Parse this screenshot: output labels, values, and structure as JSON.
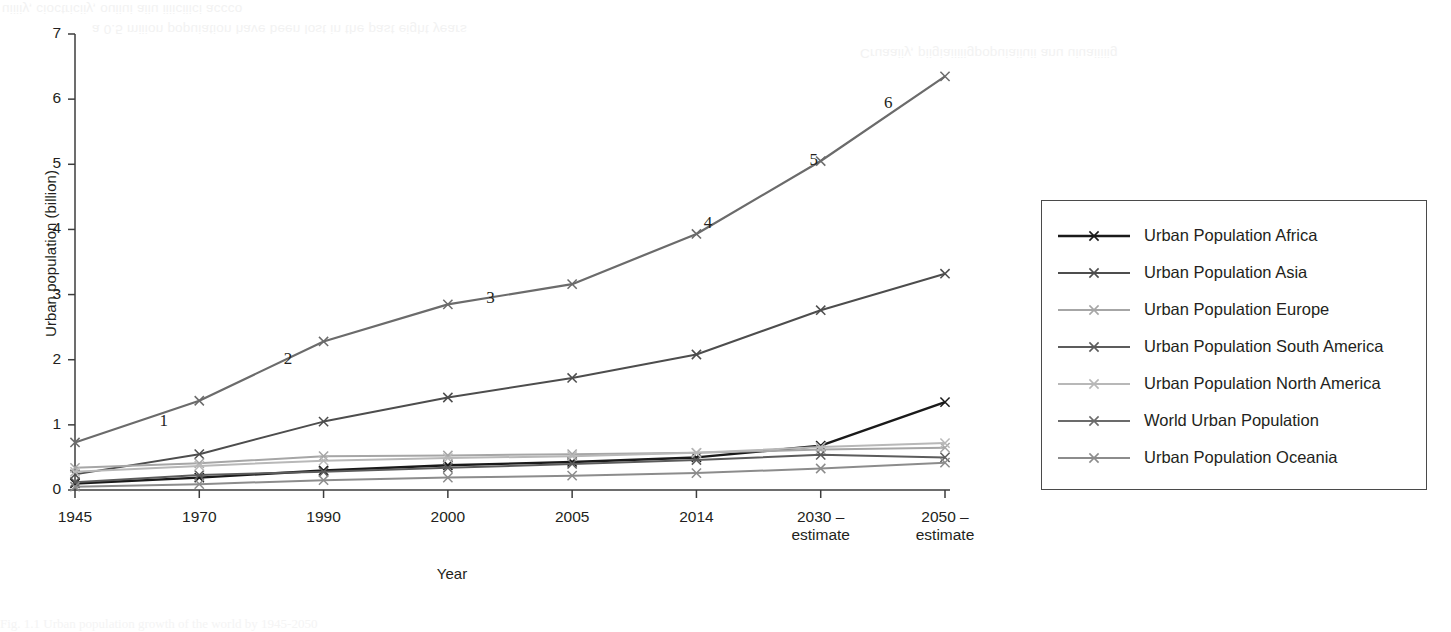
{
  "page": {
    "background_color": "#ffffff",
    "ink_color": "#231f20",
    "bleed_through_top": [
      "uiiiiy, cioctriciiy, ouiiui aiiu iiiiciiici accco",
      "a 0.5 miiion popuiation have been lost in the past eight years",
      "Cruaaiiy, piigiaiiiiigpopuiaiiuii anu uiuaiiiiig"
    ],
    "bleed_through_bottom": "Fig. 1.1 Urban population growth of the world by 1945-2050"
  },
  "chart_data": {
    "type": "line",
    "title": "",
    "xlabel": "Year",
    "ylabel": "Urban population (billion)",
    "ylim": [
      0,
      7
    ],
    "yticks": [
      0,
      1,
      2,
      3,
      4,
      5,
      6,
      7
    ],
    "ytick_labels": [
      "0",
      "1",
      "2",
      "3",
      "4",
      "5",
      "6",
      "7"
    ],
    "grid": false,
    "legend_position": "right-outside",
    "marker": "x",
    "categories": [
      "1945",
      "1970",
      "1990",
      "2000",
      "2005",
      "2014",
      "2030 –\nestimate",
      "2050 –\nestimate"
    ],
    "xtick_labels": [
      {
        "line1": "1945",
        "line2": ""
      },
      {
        "line1": "1970",
        "line2": ""
      },
      {
        "line1": "1990",
        "line2": ""
      },
      {
        "line1": "2000",
        "line2": ""
      },
      {
        "line1": "2005",
        "line2": ""
      },
      {
        "line1": "2014",
        "line2": ""
      },
      {
        "line1": "2030 –",
        "line2": "estimate"
      },
      {
        "line1": "2050 –",
        "line2": "estimate"
      }
    ],
    "series": [
      {
        "name": "Urban Population Africa",
        "color": "#1a1a1a",
        "values": [
          0.1,
          0.19,
          0.3,
          0.38,
          0.43,
          0.5,
          0.68,
          1.35
        ]
      },
      {
        "name": "Urban Population Asia",
        "color": "#4d4d4d",
        "values": [
          0.24,
          0.55,
          1.05,
          1.42,
          1.72,
          2.08,
          2.76,
          3.32
        ]
      },
      {
        "name": "Urban Population Europe",
        "color": "#a6a6a6",
        "values": [
          0.34,
          0.41,
          0.52,
          0.53,
          0.55,
          0.57,
          0.62,
          0.65
        ]
      },
      {
        "name": "Urban Population South America",
        "color": "#5c5c5c",
        "values": [
          0.12,
          0.23,
          0.28,
          0.34,
          0.4,
          0.46,
          0.54,
          0.5
        ]
      },
      {
        "name": "Urban Population North America",
        "color": "#b8b8b8",
        "values": [
          0.28,
          0.37,
          0.45,
          0.49,
          0.52,
          0.57,
          0.66,
          0.72
        ]
      },
      {
        "name": "World Urban Population",
        "color": "#6b6b6b",
        "values": [
          0.73,
          1.37,
          2.28,
          2.85,
          3.16,
          3.93,
          5.05,
          6.35
        ]
      },
      {
        "name": "Urban Population Oceania",
        "color": "#8c8c8c",
        "values": [
          0.05,
          0.09,
          0.15,
          0.19,
          0.22,
          0.26,
          0.33,
          0.42
        ]
      }
    ],
    "annotations": [
      {
        "text": "1",
        "x_index": 0.72,
        "value": 1.05
      },
      {
        "text": "2",
        "x_index": 1.72,
        "value": 2.0
      },
      {
        "text": "3",
        "x_index": 3.35,
        "value": 2.93
      },
      {
        "text": "4",
        "x_index": 5.1,
        "value": 4.09
      },
      {
        "text": "5",
        "x_index": 5.95,
        "value": 5.05
      },
      {
        "text": "6",
        "x_index": 6.55,
        "value": 5.92
      }
    ]
  },
  "legend": {
    "items": [
      {
        "label": "Urban Population Africa",
        "color": "#1a1a1a",
        "width": 2.4
      },
      {
        "label": "Urban Population Asia",
        "color": "#4d4d4d",
        "width": 2.2
      },
      {
        "label": "Urban Population Europe",
        "color": "#a6a6a6",
        "width": 1.9
      },
      {
        "label": "Urban Population South America",
        "color": "#5c5c5c",
        "width": 2.2
      },
      {
        "label": "Urban Population North America",
        "color": "#b8b8b8",
        "width": 2.0
      },
      {
        "label": "World Urban Population",
        "color": "#6b6b6b",
        "width": 2.2
      },
      {
        "label": "Urban Population Oceania",
        "color": "#8c8c8c",
        "width": 2.0
      }
    ]
  }
}
